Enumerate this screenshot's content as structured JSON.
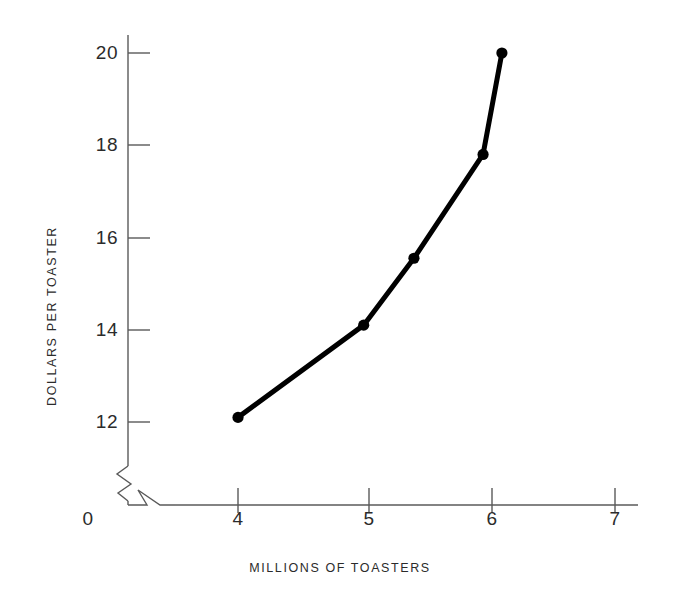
{
  "chart_data": {
    "type": "line",
    "title": "",
    "subtitle": "",
    "xlabel": "MILLIONS OF TOASTERS",
    "ylabel": "DOLLARS PER TOASTER",
    "xlim": [
      3.72,
      7.07
    ],
    "ylim": [
      11.6,
      20.5
    ],
    "xticks": [
      0,
      4,
      5,
      6,
      7
    ],
    "xtick_labels": [
      "0",
      "4",
      "5",
      "6",
      "7"
    ],
    "yticks": [
      12,
      14,
      16,
      18,
      20
    ],
    "ytick_labels": [
      "12",
      "14",
      "16",
      "18",
      "20"
    ],
    "grid": false,
    "legend": null,
    "axis_break_x": true,
    "axis_break_y": true,
    "series": [
      {
        "name": "supply",
        "marker": "circle",
        "color": "#000000",
        "line_width": 5,
        "x": [
          4.0,
          5.0,
          5.4,
          5.95,
          6.1
        ],
        "y": [
          12.1,
          14.1,
          15.55,
          17.8,
          20.0
        ],
        "points": [
          {
            "x": 4.0,
            "y": 12.1
          },
          {
            "x": 5.0,
            "y": 14.1
          },
          {
            "x": 5.4,
            "y": 15.55
          },
          {
            "x": 5.95,
            "y": 17.8
          },
          {
            "x": 6.1,
            "y": 20.0
          }
        ]
      }
    ]
  },
  "axes": {
    "x_title": "MILLIONS OF TOASTERS",
    "y_title": "DOLLARS PER TOASTER",
    "origin_label": "0",
    "x_tick_labels": [
      "4",
      "5",
      "6",
      "7"
    ],
    "y_tick_labels": [
      "20",
      "18",
      "16",
      "14",
      "12"
    ]
  },
  "colors": {
    "axis": "#5a5a5a",
    "series": "#000000",
    "text": "#2b2b2b",
    "background": "#ffffff"
  }
}
